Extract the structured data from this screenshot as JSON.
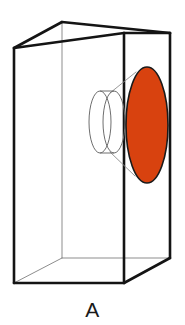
{
  "figure": {
    "caption": "A",
    "background_color": "#ffffff",
    "edge_color": "#141414",
    "hidden_edge_color": "#8d8d8d",
    "projection_line_color": "#8d8d8d",
    "cylinder_outline_color": "#6e6e6e",
    "cross_section_fill": "#d8420f",
    "cross_section_stroke": "#1a1a1a",
    "objects": [
      {
        "name": "rectangular-prism",
        "label": "box",
        "vertices": {
          "front_top_left": [
            14,
            48
          ],
          "front_top_right": [
            124,
            33
          ],
          "front_bottom_left": [
            14,
            283
          ],
          "front_bottom_right": [
            124,
            283
          ],
          "back_top_left": [
            62,
            22
          ],
          "back_top_right": [
            170,
            33
          ],
          "back_bottom_left": [
            62,
            258
          ],
          "back_bottom_right": [
            170,
            258
          ]
        }
      },
      {
        "name": "cylinder",
        "label": "cylinder",
        "near_cap_center": [
          100,
          122
        ],
        "far_cap_center": [
          114,
          122
        ],
        "cap_rx": 11,
        "cap_ry": 31
      },
      {
        "name": "cross-section-ellipse",
        "label": "elliptical cross section",
        "center": [
          147,
          125
        ],
        "rx": 21,
        "ry": 58,
        "fill": "#d8420f"
      }
    ]
  }
}
